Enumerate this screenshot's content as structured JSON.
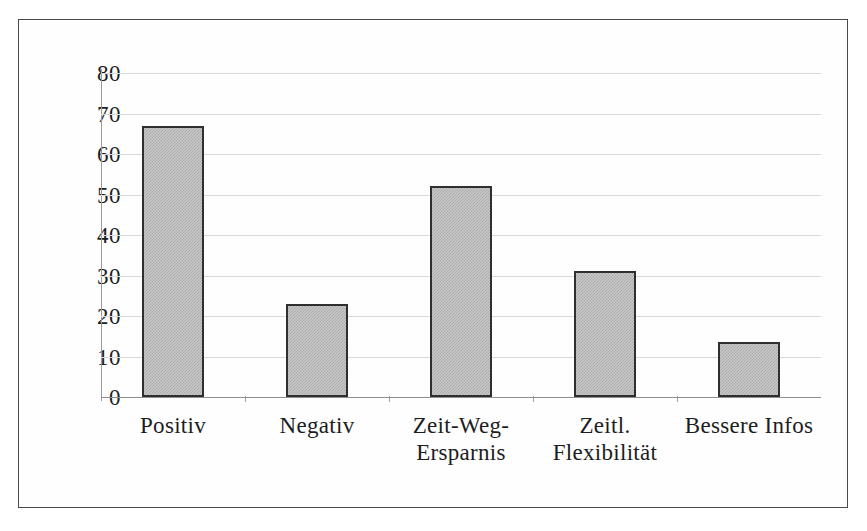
{
  "chart_data": {
    "type": "bar",
    "title": "",
    "subtitle": "",
    "xlabel": "",
    "ylabel": "",
    "categories": [
      "Positiv",
      "Negativ",
      "Zeit-Weg-\nErsparnis",
      "Zeitl.\nFlexibilität",
      "Bessere Infos"
    ],
    "values": [
      67,
      23,
      52,
      31,
      13.5
    ],
    "ylim": [
      0,
      80
    ],
    "yticks": [
      0,
      10,
      20,
      30,
      40,
      50,
      60,
      70,
      80
    ],
    "ytick_labels": [
      "0",
      "10",
      "20",
      "30",
      "40",
      "50",
      "60",
      "70",
      "80"
    ],
    "grid": true,
    "grid_axis": "y",
    "legend": false,
    "legend_position": "none",
    "bar_fill_color": "#c9c9c9",
    "bar_edge_color": "#2f2f2f",
    "gridline_color": "#d9d9d9",
    "axis_color": "#9a9a9a",
    "frame_color": "#4a4a4a",
    "background_color": "#ffffff"
  }
}
